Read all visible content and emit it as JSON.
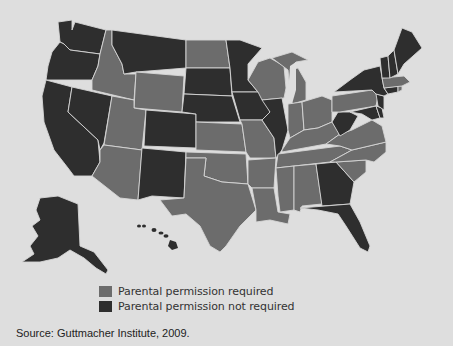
{
  "map": {
    "title": "",
    "colors": {
      "background": "#dedede",
      "required": "#6c6c6c",
      "not_required": "#2e2e2e",
      "border": "#d6d6d6"
    },
    "states_required": [
      "ID",
      "UT",
      "AZ",
      "WY",
      "ND",
      "KS",
      "OK",
      "TX",
      "MO",
      "AR",
      "LA",
      "WI",
      "MI",
      "IN",
      "OH",
      "KY",
      "TN",
      "MS",
      "AL",
      "SC",
      "NC",
      "VA",
      "PA",
      "MA",
      "RI"
    ],
    "states_not_required": [
      "WA",
      "OR",
      "CA",
      "NV",
      "MT",
      "CO",
      "NM",
      "SD",
      "NE",
      "MN",
      "IA",
      "IL",
      "WV",
      "GA",
      "FL",
      "NY",
      "VT",
      "NH",
      "ME",
      "CT",
      "NJ",
      "MD",
      "DE",
      "AK",
      "HI"
    ]
  },
  "legend": {
    "items": [
      {
        "label": "Parental permission required",
        "color": "#6c6c6c"
      },
      {
        "label": "Parental permission not required",
        "color": "#2e2e2e"
      }
    ]
  },
  "source": "Source: Guttmacher Institute, 2009."
}
